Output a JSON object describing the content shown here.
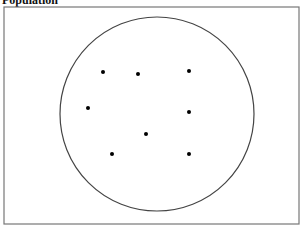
{
  "title": "Population",
  "frame": {
    "x": 4,
    "y": 7,
    "width": 295,
    "height": 217,
    "stroke": "#777777"
  },
  "circle": {
    "cx": 157,
    "cy": 114,
    "rx": 97,
    "ry": 97,
    "stroke": "#444444"
  },
  "points": [
    {
      "x": 103,
      "y": 72
    },
    {
      "x": 138,
      "y": 74
    },
    {
      "x": 189,
      "y": 71
    },
    {
      "x": 88,
      "y": 108
    },
    {
      "x": 189,
      "y": 112
    },
    {
      "x": 146,
      "y": 134
    },
    {
      "x": 112,
      "y": 154
    },
    {
      "x": 189,
      "y": 154
    }
  ]
}
